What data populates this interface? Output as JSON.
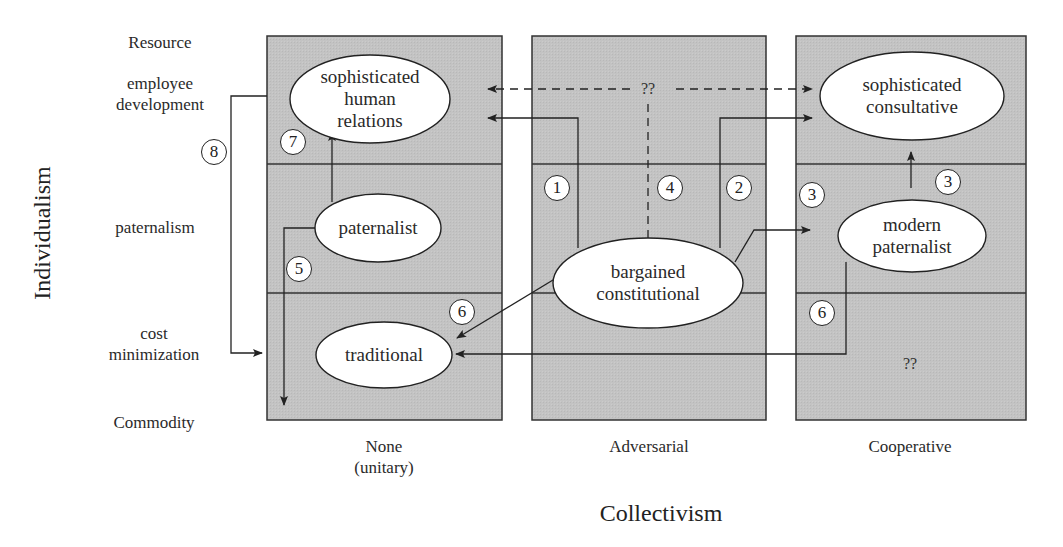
{
  "axes": {
    "y_title": "Individualism",
    "x_title": "Collectivism",
    "y_levels": [
      {
        "label": "Resource"
      },
      {
        "label": "employee\ndevelopment"
      },
      {
        "label": "paternalism"
      },
      {
        "label": "cost\nminimization"
      },
      {
        "label": "Commodity"
      }
    ],
    "x_levels": [
      {
        "label": "None\n(unitary)"
      },
      {
        "label": "Adversarial"
      },
      {
        "label": "Cooperative"
      }
    ]
  },
  "nodes": {
    "sophisticated_human_relations": "sophisticated\nhuman\nrelations",
    "sophisticated_consultative": "sophisticated\nconsultative",
    "paternalist": "paternalist",
    "modern_paternalist": "modern\npaternalist",
    "bargained_constitutional": "bargained\nconstitutional",
    "traditional": "traditional"
  },
  "unknowns": {
    "top_center": "??",
    "bottom_right": "??"
  },
  "path_markers": {
    "m1": "1",
    "m2": "2",
    "m3a": "3",
    "m3b": "3",
    "m4": "4",
    "m5": "5",
    "m6a": "6",
    "m6b": "6",
    "m7": "7",
    "m8": "8"
  },
  "colors": {
    "panel_fill": "#c2c2c2",
    "panel_border": "#333333",
    "line": "#222222",
    "ellipse_fill": "#ffffff"
  }
}
